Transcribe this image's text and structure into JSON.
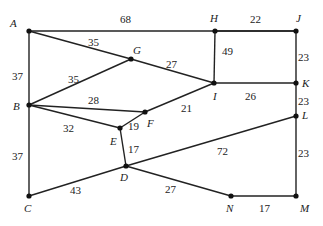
{
  "graph": {
    "nodes": [
      {
        "id": "A",
        "x": 29,
        "y": 31,
        "lx": 10,
        "ly": 27
      },
      {
        "id": "H",
        "x": 215,
        "y": 31,
        "lx": 210,
        "ly": 22
      },
      {
        "id": "J",
        "x": 296,
        "y": 31,
        "lx": 296,
        "ly": 22
      },
      {
        "id": "G",
        "x": 131,
        "y": 59,
        "lx": 133,
        "ly": 54
      },
      {
        "id": "I",
        "x": 214,
        "y": 83,
        "lx": 213,
        "ly": 100
      },
      {
        "id": "K",
        "x": 296,
        "y": 83,
        "lx": 302,
        "ly": 87
      },
      {
        "id": "B",
        "x": 29,
        "y": 105,
        "lx": 13,
        "ly": 110
      },
      {
        "id": "F",
        "x": 145,
        "y": 112,
        "lx": 147,
        "ly": 127
      },
      {
        "id": "E",
        "x": 120,
        "y": 128,
        "lx": 110,
        "ly": 145
      },
      {
        "id": "L",
        "x": 296,
        "y": 116,
        "lx": 302,
        "ly": 119
      },
      {
        "id": "D",
        "x": 126,
        "y": 166,
        "lx": 120,
        "ly": 181
      },
      {
        "id": "C",
        "x": 29,
        "y": 196,
        "lx": 24,
        "ly": 212
      },
      {
        "id": "N",
        "x": 231,
        "y": 196,
        "lx": 226,
        "ly": 212
      },
      {
        "id": "M",
        "x": 296,
        "y": 196,
        "lx": 300,
        "ly": 212
      }
    ],
    "edges": [
      {
        "from": "A",
        "to": "J",
        "weight": "68",
        "lx": 120,
        "ly": 23
      },
      {
        "from": "A",
        "to": "G",
        "weight": "35",
        "lx": 88,
        "ly": 46
      },
      {
        "from": "G",
        "to": "I",
        "weight": "27",
        "lx": 166,
        "ly": 68
      },
      {
        "from": "A",
        "to": "B",
        "weight": "37",
        "lx": 12,
        "ly": 80
      },
      {
        "from": "B",
        "to": "G",
        "weight": "35",
        "lx": 68,
        "ly": 83
      },
      {
        "from": "B",
        "to": "F",
        "weight": "28",
        "lx": 88,
        "ly": 104
      },
      {
        "from": "B",
        "to": "E",
        "weight": "32",
        "lx": 63,
        "ly": 132
      },
      {
        "from": "E",
        "to": "F",
        "weight": "19",
        "lx": 128,
        "ly": 130
      },
      {
        "from": "F",
        "to": "I",
        "weight": "21",
        "lx": 181,
        "ly": 112
      },
      {
        "from": "H",
        "to": "J",
        "weight": "22",
        "lx": 250,
        "ly": 23
      },
      {
        "from": "H",
        "to": "I",
        "weight": "49",
        "lx": 222,
        "ly": 55
      },
      {
        "from": "J",
        "to": "K",
        "weight": "23",
        "lx": 298,
        "ly": 61
      },
      {
        "from": "I",
        "to": "K",
        "weight": "26",
        "lx": 245,
        "ly": 100
      },
      {
        "from": "K",
        "to": "L",
        "weight": "23",
        "lx": 298,
        "ly": 105
      },
      {
        "from": "E",
        "to": "D",
        "weight": "17",
        "lx": 128,
        "ly": 153
      },
      {
        "from": "B",
        "to": "C",
        "weight": "37",
        "lx": 12,
        "ly": 160
      },
      {
        "from": "C",
        "to": "D",
        "weight": "43",
        "lx": 70,
        "ly": 194
      },
      {
        "from": "D",
        "to": "L",
        "weight": "72",
        "lx": 217,
        "ly": 155
      },
      {
        "from": "D",
        "to": "N",
        "weight": "27",
        "lx": 165,
        "ly": 193
      },
      {
        "from": "L",
        "to": "M",
        "weight": "23",
        "lx": 298,
        "ly": 157
      },
      {
        "from": "N",
        "to": "M",
        "weight": "17",
        "lx": 259,
        "ly": 212
      }
    ]
  }
}
